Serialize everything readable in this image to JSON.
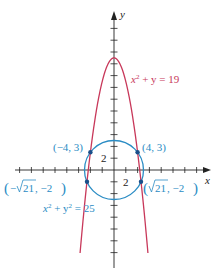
{
  "figure": {
    "origin_px": [
      114,
      170
    ],
    "unit_px": 5.9,
    "tick_step": 2,
    "colors": {
      "axis": "#222222",
      "parabola": "#c8385a",
      "circle": "#2a8cc4",
      "point": "#1a4f8a",
      "parabola_label": "#c8385a",
      "circle_label": "#2a8cc4"
    },
    "axes": {
      "x_label": "x",
      "y_label": "y",
      "x_tick_label": "2",
      "y_tick_label": "2"
    },
    "curves": {
      "parabola": {
        "equation": "x² + y = 19",
        "eq_x": "x",
        "eq_rest": " + y = 19"
      },
      "circle": {
        "equation": "x² + y² = 25",
        "eq_x": "x",
        "eq_mid": " + y",
        "eq_rest": " = 25"
      }
    },
    "points": [
      {
        "label": "(−4, 3)",
        "x": -4,
        "y": 3
      },
      {
        "label": "(4, 3)",
        "x": 4,
        "y": 3
      },
      {
        "label": "(−√21, −2)",
        "label_neg": "−",
        "label_rad": "21",
        "label_tail": ", −2",
        "x": -4.583,
        "y": -2
      },
      {
        "label": "(√21, −2)",
        "label_neg": "",
        "label_rad": "21",
        "label_tail": ", −2",
        "x": 4.583,
        "y": -2
      }
    ]
  }
}
